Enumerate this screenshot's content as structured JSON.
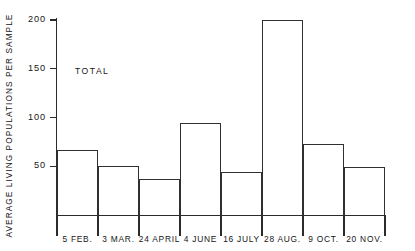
{
  "chart_data": {
    "type": "bar",
    "title": "",
    "subtitle": "",
    "xlabel": "",
    "ylabel": "AVERAGE LIVING POPULATIONS PER SAMPLE",
    "categories": [
      "5  FEB.",
      "3  MAR.",
      "24  APRIL",
      "4  JUNE",
      "16  JULY",
      "28  AUG.",
      "9  OCT.",
      "20  NOV."
    ],
    "values": [
      67,
      50,
      37,
      94,
      44,
      200,
      73,
      49
    ],
    "series": [
      {
        "name": "TOTAL",
        "values": [
          67,
          50,
          37,
          94,
          44,
          200,
          73,
          49
        ]
      }
    ],
    "ylim": [
      0,
      200
    ],
    "yticks": [
      50,
      100,
      150,
      200
    ],
    "ytick_labels": [
      "50",
      "100",
      "150",
      "200"
    ],
    "grid": false,
    "legend": false,
    "annotations": [
      {
        "text": "TOTAL",
        "x_px": 75,
        "y_px": 66
      }
    ],
    "style": {
      "bar_fill": "#ffffff",
      "bar_stroke": "#303030",
      "axis_color": "#2b2b2b",
      "text_color": "#161616",
      "background": "#ffffff"
    }
  }
}
